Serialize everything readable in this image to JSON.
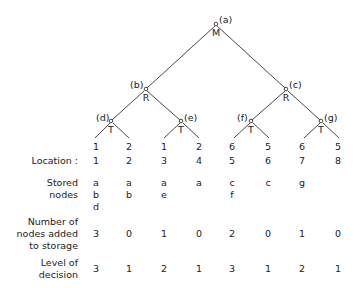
{
  "tree": {
    "nodes": [
      {
        "id": "a",
        "label": "(a)",
        "type": "M"
      },
      {
        "id": "b",
        "label": "(b)",
        "type": "R"
      },
      {
        "id": "c",
        "label": "(c)",
        "type": "R"
      },
      {
        "id": "d",
        "label": "(d)",
        "type": "T"
      },
      {
        "id": "e",
        "label": "(e)",
        "type": "T"
      },
      {
        "id": "f",
        "label": "(f)",
        "type": "T"
      },
      {
        "id": "g",
        "label": "(g)",
        "type": "T"
      }
    ],
    "leaf_values": [
      "1",
      "2",
      "1",
      "2",
      "6",
      "5",
      "6",
      "5"
    ]
  },
  "table": {
    "location_label": "Location :",
    "locations": [
      "1",
      "2",
      "3",
      "4",
      "5",
      "6",
      "7",
      "8"
    ],
    "stored_label_1": "Stored",
    "stored_label_2": "nodes",
    "stored": [
      [
        "a",
        "b",
        "d"
      ],
      [
        "a",
        "b"
      ],
      [
        "a",
        "e"
      ],
      [
        "a"
      ],
      [
        "c",
        "f"
      ],
      [
        "c"
      ],
      [
        "g"
      ],
      []
    ],
    "added_label_1": "Number of",
    "added_label_2": "nodes added",
    "added_label_3": "to storage",
    "added": [
      "3",
      "0",
      "1",
      "0",
      "2",
      "0",
      "1",
      "0"
    ],
    "level_label_1": "Level of",
    "level_label_2": "decision",
    "level": [
      "3",
      "1",
      "2",
      "1",
      "3",
      "1",
      "2",
      "1"
    ]
  }
}
